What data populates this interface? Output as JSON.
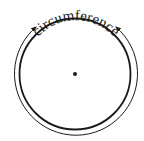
{
  "diagram": {
    "label": "circumference",
    "colors": {
      "stroke": "#1a1a1a",
      "background": "#ffffff"
    },
    "elements": [
      {
        "id": "circle",
        "type": "circle",
        "description": "inner circle"
      },
      {
        "id": "center-point",
        "type": "dot",
        "description": "center of circle"
      },
      {
        "id": "circumference-arc",
        "type": "arc-with-arrows",
        "description": "outer arc with arrowheads at both ends pointing toward the label"
      },
      {
        "id": "circumference-label",
        "type": "text",
        "description": "curved text along top of circle"
      }
    ]
  }
}
